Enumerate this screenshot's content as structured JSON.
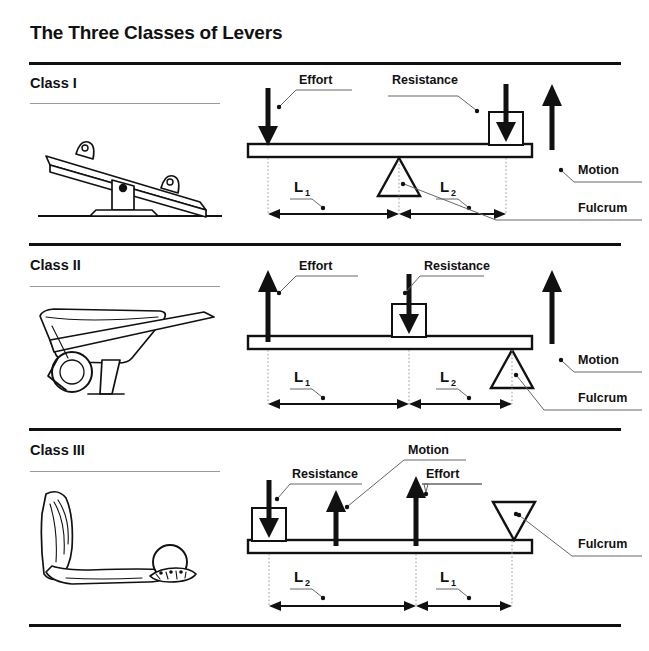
{
  "title": "The Three Classes of Levers",
  "labels": {
    "effort": "Effort",
    "resistance": "Resistance",
    "motion": "Motion",
    "fulcrum": "Fulcrum",
    "L": "L",
    "one": "1",
    "two": "2"
  },
  "sections": [
    {
      "id": "class-1",
      "name": "Class I",
      "illustration": "seesaw-icon",
      "fulcrum_position": "center",
      "effort_direction": "down",
      "effort_position": "left-end",
      "resistance_direction": "down",
      "resistance_position": "right-end",
      "motion_direction": "up",
      "arm_left": "L",
      "arm_left_sub": "1",
      "arm_right": "L",
      "arm_right_sub": "2",
      "callouts": [
        "Effort",
        "Resistance",
        "Motion",
        "Fulcrum"
      ]
    },
    {
      "id": "class-2",
      "name": "Class II",
      "illustration": "wheelbarrow-icon",
      "fulcrum_position": "right-end",
      "effort_direction": "up",
      "effort_position": "left-end",
      "resistance_direction": "down",
      "resistance_position": "middle",
      "motion_direction": "up",
      "arm_left": "L",
      "arm_left_sub": "1",
      "arm_right": "L",
      "arm_right_sub": "2",
      "callouts": [
        "Effort",
        "Resistance",
        "Motion",
        "Fulcrum"
      ]
    },
    {
      "id": "class-3",
      "name": "Class III",
      "illustration": "arm-holding-ball-icon",
      "fulcrum_position": "right-end",
      "effort_direction": "up",
      "effort_position": "middle-right",
      "resistance_direction": "down",
      "resistance_position": "left-end",
      "motion_direction": "up",
      "arm_left": "L",
      "arm_left_sub": "2",
      "arm_right": "L",
      "arm_right_sub": "1",
      "callouts": [
        "Resistance",
        "Motion",
        "Effort",
        "Fulcrum"
      ]
    }
  ]
}
